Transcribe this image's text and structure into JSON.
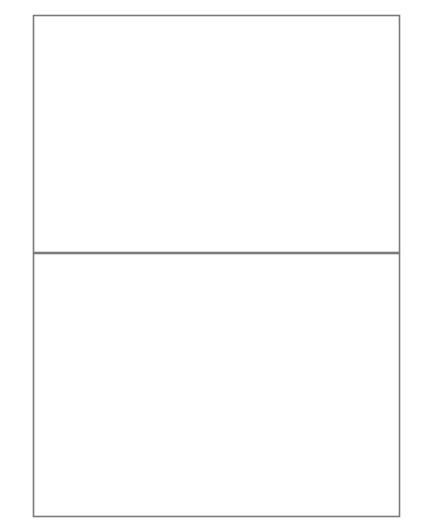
{
  "figure": {
    "ylabel_chars": [
      "归",
      "一",
      "化",
      "强",
      "度"
    ],
    "ylabel_full": "归一化强度",
    "frame_color": "#7a7a7a",
    "curve_color": "#8a8a8a",
    "dash_color": "#777777",
    "text_color": "#3a3a3a",
    "background": "#ffffff"
  },
  "chart_data": [
    {
      "type": "line",
      "id": "top-panel",
      "title": "",
      "xlabel": "",
      "ylabel": "",
      "xlim": [
        -3.65,
        3.65
      ],
      "ylim": [
        -11.2,
        11.2
      ],
      "xunit": "pi",
      "grid": false,
      "legend": null,
      "xtick_values": [
        -3,
        -2,
        -1,
        0,
        1,
        2,
        3
      ],
      "xtick_labels": [
        "-3π",
        "-2π",
        "-π",
        "",
        "π",
        "2π",
        "3π"
      ],
      "ytick_values": [
        10,
        5,
        -5,
        -10
      ],
      "ytick_labels": [
        "10",
        "5",
        "-5",
        "-10"
      ],
      "yminor_step": 1,
      "series": [
        {
          "name": "y = tan(x)",
          "func": "tan",
          "color": "#8a8a8a"
        },
        {
          "name": "y = x",
          "func": "identity",
          "color": "#8a8a8a"
        }
      ],
      "annotation_lines_x_pi": [
        -2.459,
        -1.4303,
        1.4303,
        2.459
      ]
    },
    {
      "type": "line",
      "id": "bottom-panel",
      "title": "",
      "xlabel": "",
      "ylabel": "归一化强度",
      "xlim": [
        -3.65,
        3.65
      ],
      "ylim": [
        0,
        1.06
      ],
      "xunit": "pi",
      "grid": false,
      "legend": null,
      "xtick_values": [
        -3,
        -2,
        -1,
        0,
        1,
        2,
        3
      ],
      "xtick_labels": [
        "-3π",
        "-2π",
        "-π",
        "0",
        "π",
        "2π",
        "3π"
      ],
      "ytick_values": [
        1.0,
        0.8,
        0.6,
        0.4,
        0.2
      ],
      "ytick_labels": [
        "1.0",
        "0.8",
        "0.6",
        "0.4",
        "0.2"
      ],
      "yminor_step": 0.05,
      "series": [
        {
          "name": "sinc^2(x)",
          "func": "sinc2",
          "color": "#8a8a8a"
        }
      ],
      "annotations": [
        {
          "label": "-2.46π",
          "x_pi": -2.459,
          "y": 0.0083
        },
        {
          "label": "-1.43π",
          "x_pi": -1.4303,
          "y": 0.0472
        },
        {
          "label": "1.43π",
          "x_pi": 1.4303,
          "y": 0.0472
        },
        {
          "label": "2.46π",
          "x_pi": 2.459,
          "y": 0.0083
        }
      ],
      "annotation_lines_x_pi": [
        -2.459,
        -1.4303,
        1.4303,
        2.459
      ]
    }
  ],
  "annotation_labels": {
    "left_outer": "-2.46π",
    "left_inner": "-1.43π",
    "right_inner": "1.43π",
    "right_outer": "2.46π"
  },
  "top_yticks": {
    "t10": "10",
    "t5": "5",
    "tm5": "-5",
    "tm10": "-10"
  },
  "bottom_yticks": {
    "t10": "1.0",
    "t08": "0.8",
    "t06": "0.6",
    "t04": "0.4",
    "t02": "0.2"
  },
  "xticks": {
    "m3": "-3π",
    "m2": "-2π",
    "m1": "-π",
    "zero": "0",
    "p1": "π",
    "p2": "2π",
    "p3": "3π"
  },
  "top_xticks": {
    "m3": "-3π",
    "m2": "-2π",
    "m1": "-π",
    "p1": "π",
    "p2": "2π",
    "p3": "3π"
  }
}
